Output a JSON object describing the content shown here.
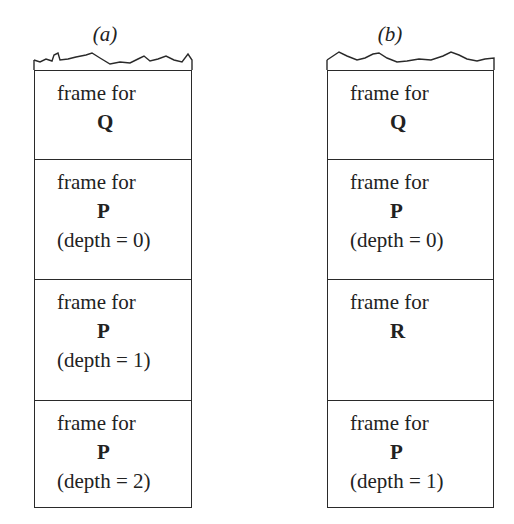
{
  "diagram": {
    "panels": [
      {
        "label": "(a)",
        "frames": [
          {
            "line1": "frame for",
            "proc": "Q",
            "depth": ""
          },
          {
            "line1": "frame for",
            "proc": "P",
            "depth": "(depth = 0)"
          },
          {
            "line1": "frame for",
            "proc": "P",
            "depth": "(depth = 1)"
          },
          {
            "line1": "frame for",
            "proc": "P",
            "depth": "(depth = 2)"
          }
        ]
      },
      {
        "label": "(b)",
        "frames": [
          {
            "line1": "frame for",
            "proc": "Q",
            "depth": ""
          },
          {
            "line1": "frame for",
            "proc": "P",
            "depth": "(depth = 0)"
          },
          {
            "line1": "frame for",
            "proc": "R",
            "depth": ""
          },
          {
            "line1": "frame for",
            "proc": "P",
            "depth": "(depth = 1)"
          }
        ]
      }
    ]
  }
}
